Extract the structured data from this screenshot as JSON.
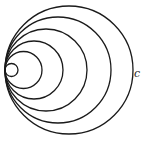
{
  "diagram": {
    "title": "",
    "stroke_color": "#1a1a1a",
    "background": "#ffffff",
    "tangent_point": {
      "x": 5,
      "y": 70
    },
    "circles": [
      {
        "r": 64
      },
      {
        "r": 53
      },
      {
        "r": 41
      },
      {
        "r": 29
      },
      {
        "r": 18.5
      },
      {
        "r": 6.5
      }
    ],
    "label": {
      "text": "c",
      "x": 138,
      "y": 77
    }
  }
}
